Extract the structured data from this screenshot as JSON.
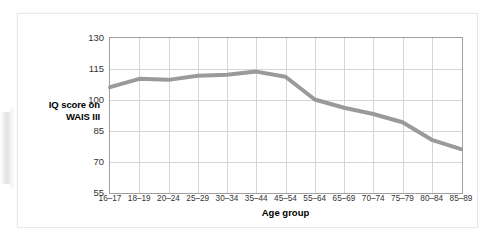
{
  "figure": {
    "caption_present": false,
    "line_color": "#9a9a9a",
    "grid_color": "#d6d6d6",
    "axis_color": "#9f9f9f",
    "card_background": "#ffffff"
  },
  "chart_data": {
    "type": "line",
    "title": "",
    "xlabel": "Age group",
    "ylabel": "IQ score on WAIS III",
    "ylabel_lines": [
      "IQ score on",
      "WAIS III"
    ],
    "categories": [
      "16–17",
      "18–19",
      "20–24",
      "25–29",
      "30–34",
      "35–44",
      "45–54",
      "55–64",
      "65–69",
      "70–74",
      "75–79",
      "80–84",
      "85–89"
    ],
    "values": [
      106,
      110,
      109.5,
      111.5,
      112,
      113.5,
      111,
      100,
      96,
      93,
      89,
      80.5,
      76
    ],
    "series": [
      {
        "name": "IQ score on WAIS III",
        "color": "#9a9a9a",
        "values": [
          106,
          110,
          109.5,
          111.5,
          112,
          113.5,
          111,
          100,
          96,
          93,
          89,
          80.5,
          76
        ]
      }
    ],
    "ylim": [
      55,
      130
    ],
    "yticks": [
      55,
      70,
      85,
      100,
      115,
      130
    ],
    "ytick_labels": [
      "55",
      "70",
      "85",
      "100",
      "115",
      "130"
    ],
    "xlim_categories": 13,
    "grid": true,
    "grid_axes": "both",
    "legend": false,
    "legend_position": "none",
    "markers": false,
    "line_width_px": 4
  }
}
